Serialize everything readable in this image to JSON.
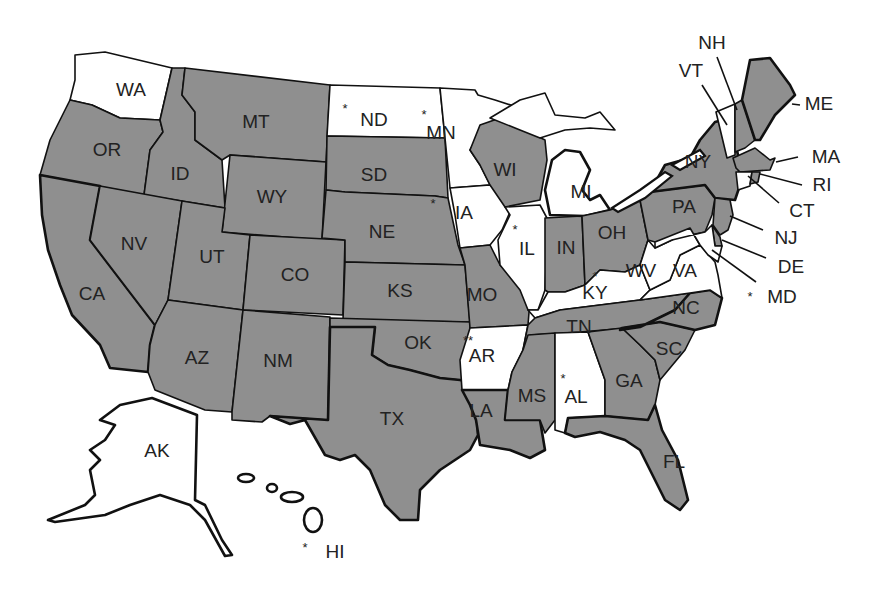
{
  "map": {
    "title": "",
    "colors": {
      "shaded": "#8f8f8f",
      "unshaded": "#ffffff",
      "border": "#111111",
      "text": "#222222"
    },
    "legend": {
      "shaded_meaning": "",
      "asterisk_meaning": "",
      "double_asterisk_meaning": ""
    },
    "states": [
      {
        "abbr": "WA",
        "shaded": false,
        "mark": ""
      },
      {
        "abbr": "OR",
        "shaded": true,
        "mark": ""
      },
      {
        "abbr": "CA",
        "shaded": true,
        "mark": ""
      },
      {
        "abbr": "ID",
        "shaded": true,
        "mark": ""
      },
      {
        "abbr": "NV",
        "shaded": true,
        "mark": ""
      },
      {
        "abbr": "MT",
        "shaded": true,
        "mark": ""
      },
      {
        "abbr": "WY",
        "shaded": true,
        "mark": ""
      },
      {
        "abbr": "UT",
        "shaded": true,
        "mark": ""
      },
      {
        "abbr": "AZ",
        "shaded": true,
        "mark": ""
      },
      {
        "abbr": "CO",
        "shaded": true,
        "mark": ""
      },
      {
        "abbr": "NM",
        "shaded": true,
        "mark": ""
      },
      {
        "abbr": "ND",
        "shaded": false,
        "mark": "*"
      },
      {
        "abbr": "SD",
        "shaded": true,
        "mark": ""
      },
      {
        "abbr": "NE",
        "shaded": true,
        "mark": ""
      },
      {
        "abbr": "KS",
        "shaded": true,
        "mark": ""
      },
      {
        "abbr": "OK",
        "shaded": true,
        "mark": ""
      },
      {
        "abbr": "TX",
        "shaded": true,
        "mark": ""
      },
      {
        "abbr": "MN",
        "shaded": false,
        "mark": "*"
      },
      {
        "abbr": "IA",
        "shaded": false,
        "mark": "*"
      },
      {
        "abbr": "MO",
        "shaded": true,
        "mark": ""
      },
      {
        "abbr": "AR",
        "shaded": false,
        "mark": "**"
      },
      {
        "abbr": "LA",
        "shaded": true,
        "mark": ""
      },
      {
        "abbr": "WI",
        "shaded": true,
        "mark": ""
      },
      {
        "abbr": "IL",
        "shaded": false,
        "mark": "*"
      },
      {
        "abbr": "MI",
        "shaded": false,
        "mark": ""
      },
      {
        "abbr": "IN",
        "shaded": true,
        "mark": ""
      },
      {
        "abbr": "OH",
        "shaded": true,
        "mark": ""
      },
      {
        "abbr": "KY",
        "shaded": false,
        "mark": "*"
      },
      {
        "abbr": "TN",
        "shaded": true,
        "mark": ""
      },
      {
        "abbr": "MS",
        "shaded": true,
        "mark": ""
      },
      {
        "abbr": "AL",
        "shaded": false,
        "mark": "*"
      },
      {
        "abbr": "GA",
        "shaded": true,
        "mark": ""
      },
      {
        "abbr": "FL",
        "shaded": true,
        "mark": ""
      },
      {
        "abbr": "SC",
        "shaded": true,
        "mark": ""
      },
      {
        "abbr": "NC",
        "shaded": true,
        "mark": ""
      },
      {
        "abbr": "VA",
        "shaded": false,
        "mark": ""
      },
      {
        "abbr": "WV",
        "shaded": false,
        "mark": ""
      },
      {
        "abbr": "PA",
        "shaded": true,
        "mark": ""
      },
      {
        "abbr": "NY",
        "shaded": true,
        "mark": ""
      },
      {
        "abbr": "VT",
        "shaded": false,
        "mark": ""
      },
      {
        "abbr": "NH",
        "shaded": true,
        "mark": ""
      },
      {
        "abbr": "ME",
        "shaded": true,
        "mark": ""
      },
      {
        "abbr": "MA",
        "shaded": true,
        "mark": ""
      },
      {
        "abbr": "RI",
        "shaded": true,
        "mark": ""
      },
      {
        "abbr": "CT",
        "shaded": false,
        "mark": ""
      },
      {
        "abbr": "NJ",
        "shaded": true,
        "mark": ""
      },
      {
        "abbr": "DE",
        "shaded": true,
        "mark": ""
      },
      {
        "abbr": "MD",
        "shaded": false,
        "mark": "*"
      },
      {
        "abbr": "AK",
        "shaded": false,
        "mark": ""
      },
      {
        "abbr": "HI",
        "shaded": false,
        "mark": "*"
      }
    ],
    "labels": {
      "WA": "WA",
      "OR": "OR",
      "CA": "CA",
      "ID": "ID",
      "NV": "NV",
      "MT": "MT",
      "WY": "WY",
      "UT": "UT",
      "AZ": "AZ",
      "CO": "CO",
      "NM": "NM",
      "ND": "ND",
      "SD": "SD",
      "NE": "NE",
      "KS": "KS",
      "OK": "OK",
      "TX": "TX",
      "MN": "MN",
      "IA": "IA",
      "MO": "MO",
      "AR": "AR",
      "LA": "LA",
      "WI": "WI",
      "IL": "IL",
      "MI": "MI",
      "IN": "IN",
      "OH": "OH",
      "KY": "KY",
      "TN": "TN",
      "MS": "MS",
      "AL": "AL",
      "GA": "GA",
      "FL": "FL",
      "SC": "SC",
      "NC": "NC",
      "VA": "VA",
      "WV": "WV",
      "PA": "PA",
      "NY": "NY",
      "VT": "VT",
      "NH": "NH",
      "ME": "ME",
      "MA": "MA",
      "RI": "RI",
      "CT": "CT",
      "NJ": "NJ",
      "DE": "DE",
      "MD": "MD",
      "AK": "AK",
      "HI": "HI"
    },
    "marks": {
      "single": "*",
      "double": "**"
    }
  }
}
